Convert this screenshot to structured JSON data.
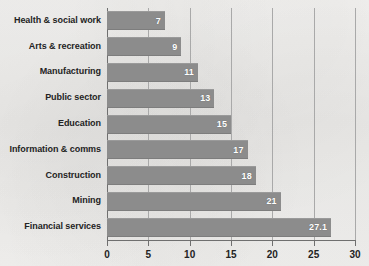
{
  "chart_data": {
    "type": "bar",
    "orientation": "horizontal",
    "title": "",
    "subtitle": "",
    "xlabel": "",
    "ylabel": "",
    "categories": [
      "Health & social work",
      "Arts & recreation",
      "Manufacturing",
      "Public sector",
      "Education",
      "Information & comms",
      "Construction",
      "Mining",
      "Financial services"
    ],
    "values": [
      7,
      9,
      11,
      13,
      15,
      17,
      18,
      21,
      27.1
    ],
    "value_labels": [
      "7",
      "9",
      "11",
      "13",
      "15",
      "17",
      "18",
      "21",
      "27.1"
    ],
    "xlim": [
      0,
      30
    ],
    "xticks": [
      0,
      5,
      10,
      15,
      20,
      25,
      30
    ],
    "xtick_labels": [
      "0",
      "5",
      "10",
      "15",
      "20",
      "25",
      "30"
    ],
    "grid": "vertical",
    "legend": "none",
    "bar_color": "#8c8c8c",
    "value_label_color": "#ffffff",
    "axis_color": "#6f6f6f",
    "gridline_color": "#a9a9a9",
    "category_label_color": "#232323",
    "background_color": "#f2f1ef"
  }
}
